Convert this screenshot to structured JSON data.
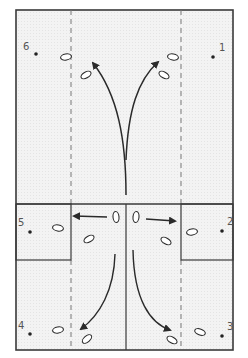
{
  "diagram": {
    "type": "court-positioning-drill",
    "colors": {
      "background": "#f2f2f2",
      "outline": "#3a3a3a",
      "dashed": "#777777",
      "arrow": "#2a2a2a",
      "label": "#555555"
    },
    "positions": [
      {
        "id": "1",
        "label": "1",
        "x": 213,
        "y": 57,
        "lx": 219,
        "ly": 43
      },
      {
        "id": "2",
        "label": "2",
        "x": 222,
        "y": 231,
        "lx": 227,
        "ly": 217
      },
      {
        "id": "3",
        "label": "3",
        "x": 222,
        "y": 336,
        "lx": 227,
        "ly": 322
      },
      {
        "id": "4",
        "label": "4",
        "x": 30,
        "y": 334,
        "lx": 18,
        "ly": 321
      },
      {
        "id": "5",
        "label": "5",
        "x": 30,
        "y": 232,
        "lx": 18,
        "ly": 218
      },
      {
        "id": "6",
        "label": "6",
        "x": 36,
        "y": 54,
        "lx": 23,
        "ly": 42
      }
    ],
    "footprints": [
      {
        "x": 66,
        "y": 57,
        "rot": -10
      },
      {
        "x": 86,
        "y": 75,
        "rot": -30
      },
      {
        "x": 173,
        "y": 57,
        "rot": 10
      },
      {
        "x": 164,
        "y": 75,
        "rot": 30
      },
      {
        "x": 116,
        "y": 217,
        "rot": 85
      },
      {
        "x": 136,
        "y": 217,
        "rot": 95
      },
      {
        "x": 89,
        "y": 239,
        "rot": -30
      },
      {
        "x": 166,
        "y": 241,
        "rot": 30
      },
      {
        "x": 58,
        "y": 228,
        "rot": 10
      },
      {
        "x": 192,
        "y": 232,
        "rot": -10
      },
      {
        "x": 58,
        "y": 330,
        "rot": -10
      },
      {
        "x": 87,
        "y": 339,
        "rot": -40
      },
      {
        "x": 172,
        "y": 340,
        "rot": 30
      },
      {
        "x": 200,
        "y": 332,
        "rot": 20
      }
    ]
  }
}
